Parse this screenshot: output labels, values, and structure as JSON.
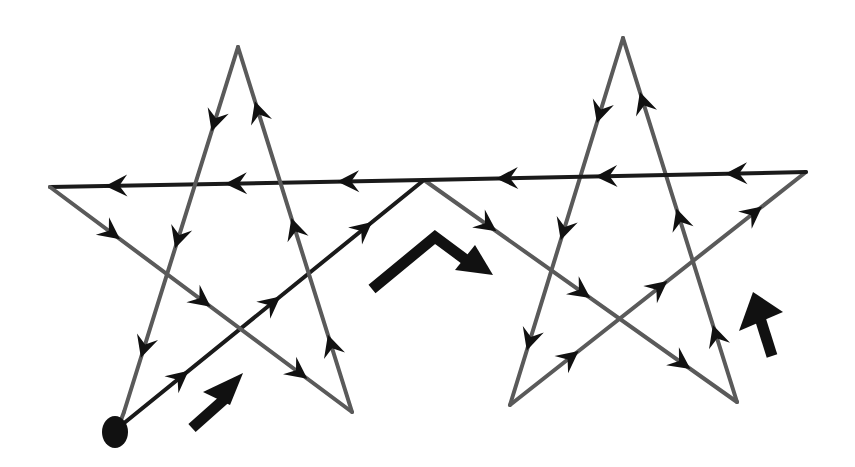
{
  "diagram": {
    "colors": {
      "line": "#5a5a5a",
      "arrow": "#111111",
      "background": "#ffffff"
    },
    "stars": [
      {
        "name": "left-star",
        "points": [
          "top",
          "left",
          "right",
          "bottom-left",
          "bottom-right"
        ]
      },
      {
        "name": "right-star",
        "points": [
          "top",
          "left",
          "right",
          "bottom-left",
          "bottom-right"
        ]
      }
    ],
    "path_order": [
      "start-dot",
      "left-star bottom-left",
      "junction (shared right/left tip)",
      "right-star bottom-right",
      "right-star top",
      "right-star bottom-left",
      "right-star right",
      "right-star left",
      "left-star left",
      "left-star bottom-right",
      "left-star top",
      "left-star bottom-left"
    ],
    "direction_hints": [
      {
        "name": "direction-arrow-up-right",
        "meaning": "start: go up-right from dot"
      },
      {
        "name": "direction-arrow-chevron",
        "meaning": "over the junction then down-right"
      },
      {
        "name": "direction-arrow-up",
        "meaning": "go up on right star"
      }
    ]
  }
}
